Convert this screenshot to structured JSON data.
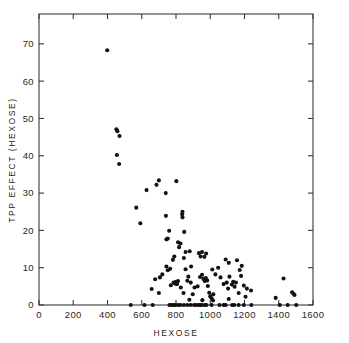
{
  "chart_data": {
    "type": "scatter",
    "title": "",
    "xlabel": "HEXOSE",
    "ylabel": "TPP  EFFECT  (HEXOSE)",
    "xlim": [
      0,
      1600
    ],
    "ylim": [
      0,
      78
    ],
    "xticks": [
      0,
      200,
      400,
      600,
      800,
      1000,
      1200,
      1400,
      1600
    ],
    "xticklabels": [
      "0",
      "200",
      "400",
      "600",
      "800",
      "1000",
      "1200",
      "1400",
      "1600"
    ],
    "yticks": [
      0,
      10,
      20,
      30,
      40,
      50,
      60,
      70
    ],
    "yticklabels": [
      "0",
      "10",
      "20",
      "30",
      "40",
      "50",
      "60",
      "70"
    ],
    "grid": false,
    "legend": null,
    "frame": "box-all-sides-inward-ticks",
    "marker": "filled-circle",
    "marker_color": "#111111",
    "marker_size_px": 3.0,
    "n_points": 131,
    "points": [
      [
        398,
        68.3
      ],
      [
        452,
        47.1
      ],
      [
        458,
        46.6
      ],
      [
        470,
        45.3
      ],
      [
        455,
        40.2
      ],
      [
        468,
        37.8
      ],
      [
        700,
        33.4
      ],
      [
        802,
        33.2
      ],
      [
        686,
        32.2
      ],
      [
        628,
        30.8
      ],
      [
        740,
        30.0
      ],
      [
        568,
        26.1
      ],
      [
        741,
        23.9
      ],
      [
        836,
        24.3
      ],
      [
        838,
        23.5
      ],
      [
        592,
        21.9
      ],
      [
        838,
        25.0
      ],
      [
        760,
        19.9
      ],
      [
        848,
        19.6
      ],
      [
        744,
        17.6
      ],
      [
        752,
        17.8
      ],
      [
        812,
        16.8
      ],
      [
        826,
        16.5
      ],
      [
        818,
        15.5
      ],
      [
        856,
        14.2
      ],
      [
        880,
        14.4
      ],
      [
        934,
        13.9
      ],
      [
        944,
        13.0
      ],
      [
        952,
        14.2
      ],
      [
        966,
        12.9
      ],
      [
        976,
        13.8
      ],
      [
        846,
        12.6
      ],
      [
        782,
        12.1
      ],
      [
        790,
        13.0
      ],
      [
        1090,
        12.2
      ],
      [
        1108,
        11.3
      ],
      [
        1156,
        12.0
      ],
      [
        1184,
        10.5
      ],
      [
        1046,
        10.0
      ],
      [
        1012,
        9.5
      ],
      [
        888,
        10.3
      ],
      [
        856,
        9.6
      ],
      [
        744,
        10.3
      ],
      [
        752,
        9.3
      ],
      [
        766,
        9.7
      ],
      [
        720,
        8.2
      ],
      [
        706,
        7.4
      ],
      [
        678,
        6.9
      ],
      [
        658,
        4.3
      ],
      [
        700,
        3.2
      ],
      [
        770,
        5.3
      ],
      [
        786,
        6.0
      ],
      [
        796,
        5.7
      ],
      [
        800,
        6.2
      ],
      [
        806,
        5.6
      ],
      [
        812,
        6.4
      ],
      [
        828,
        4.7
      ],
      [
        844,
        3.2
      ],
      [
        866,
        6.5
      ],
      [
        872,
        7.6
      ],
      [
        886,
        6.0
      ],
      [
        898,
        2.9
      ],
      [
        908,
        4.7
      ],
      [
        926,
        5.0
      ],
      [
        940,
        7.5
      ],
      [
        952,
        8.1
      ],
      [
        960,
        7.0
      ],
      [
        968,
        6.4
      ],
      [
        974,
        7.2
      ],
      [
        982,
        6.6
      ],
      [
        986,
        5.1
      ],
      [
        994,
        3.3
      ],
      [
        1000,
        2.3
      ],
      [
        1008,
        1.8
      ],
      [
        1018,
        2.9
      ],
      [
        1030,
        8.2
      ],
      [
        1060,
        7.4
      ],
      [
        1078,
        5.6
      ],
      [
        1096,
        6.0
      ],
      [
        1104,
        4.4
      ],
      [
        1112,
        7.6
      ],
      [
        1126,
        5.5
      ],
      [
        1134,
        6.2
      ],
      [
        1142,
        4.9
      ],
      [
        1150,
        6.0
      ],
      [
        1166,
        3.2
      ],
      [
        1172,
        9.4
      ],
      [
        1180,
        7.8
      ],
      [
        1196,
        5.2
      ],
      [
        1206,
        2.2
      ],
      [
        1214,
        4.4
      ],
      [
        1238,
        3.9
      ],
      [
        1428,
        7.1
      ],
      [
        1382,
        1.9
      ],
      [
        1478,
        3.4
      ],
      [
        1486,
        3.0
      ],
      [
        1492,
        2.7
      ],
      [
        878,
        1.4
      ],
      [
        954,
        1.3
      ],
      [
        1016,
        1.2
      ],
      [
        1108,
        1.6
      ],
      [
        536,
        0.0
      ],
      [
        616,
        0.0
      ],
      [
        664,
        0.0
      ],
      [
        762,
        0.0
      ],
      [
        774,
        0.0
      ],
      [
        786,
        0.0
      ],
      [
        796,
        0.0
      ],
      [
        812,
        0.0
      ],
      [
        826,
        0.0
      ],
      [
        846,
        0.0
      ],
      [
        866,
        0.0
      ],
      [
        886,
        0.0
      ],
      [
        906,
        0.0
      ],
      [
        918,
        0.0
      ],
      [
        932,
        0.0
      ],
      [
        944,
        0.0
      ],
      [
        952,
        0.0
      ],
      [
        968,
        0.0
      ],
      [
        978,
        0.0
      ],
      [
        1008,
        0.0
      ],
      [
        1054,
        0.0
      ],
      [
        1078,
        0.0
      ],
      [
        1090,
        0.0
      ],
      [
        1128,
        0.0
      ],
      [
        1140,
        0.0
      ],
      [
        1166,
        0.0
      ],
      [
        1196,
        0.0
      ],
      [
        1240,
        0.0
      ],
      [
        1406,
        0.0
      ],
      [
        1452,
        0.0
      ],
      [
        1502,
        0.0
      ]
    ]
  }
}
